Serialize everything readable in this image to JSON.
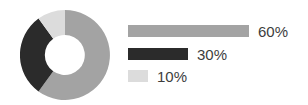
{
  "chart_data": {
    "type": "pie",
    "variant": "donut",
    "title": "",
    "subtitle": "",
    "xlabel": "",
    "ylabel": "",
    "legend_position": "right",
    "grid": false,
    "categories": [
      "60%",
      "30%",
      "10%"
    ],
    "values": [
      60,
      30,
      10
    ],
    "value_labels": [
      "60%",
      "30%",
      "10%"
    ],
    "colors": [
      "#a3a3a3",
      "#2b2b2b",
      "#dcdcdc"
    ],
    "slices": [
      {
        "label": "60%",
        "value": 60,
        "color": "#a3a3a3",
        "start_angle": 0,
        "end_angle": 216
      },
      {
        "label": "30%",
        "value": 30,
        "color": "#2b2b2b",
        "start_angle": 216,
        "end_angle": 324
      },
      {
        "label": "10%",
        "value": 10,
        "color": "#dcdcdc",
        "start_angle": 324,
        "end_angle": 360
      }
    ],
    "legend_entries": [
      {
        "label": "60%",
        "value": 60,
        "color": "#a3a3a3",
        "bar_width": 121
      },
      {
        "label": "30%",
        "value": 30,
        "color": "#2b2b2b",
        "bar_width": 60
      },
      {
        "label": "10%",
        "value": 10,
        "color": "#dcdcdc",
        "bar_width": 20
      }
    ]
  },
  "style": {
    "background": "#ffffff",
    "text_color": "#3d3d3d",
    "donut_inner_color": "#ffffff"
  }
}
